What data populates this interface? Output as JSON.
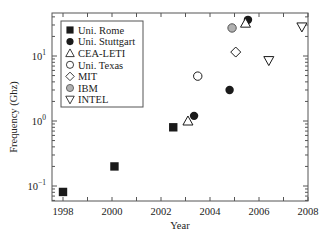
{
  "chart_data": {
    "type": "scatter",
    "title": "",
    "xlabel": "Year",
    "ylabel": "Frequency (Ghz)",
    "xlim": [
      1997.55,
      2008
    ],
    "ylim": [
      0.059,
      46
    ],
    "yscale": "log",
    "grid": false,
    "legend_position": "upper left",
    "x_ticks": [
      1998,
      2000,
      2002,
      2004,
      2006,
      2008
    ],
    "x_tick_labels": [
      "1998",
      "2000",
      "2002",
      "2004",
      "2006",
      "2008"
    ],
    "y_ticks": [
      0.1,
      1,
      10
    ],
    "y_tick_labels": [
      "10^-1",
      "10^0",
      "10^1"
    ],
    "series": [
      {
        "name": "Uni. Rome",
        "marker": "filled-square",
        "points": [
          [
            1998.0,
            0.081
          ],
          [
            2000.1,
            0.2
          ],
          [
            2002.5,
            0.8
          ]
        ]
      },
      {
        "name": "Uni. Stuttgart",
        "marker": "filled-circle",
        "points": [
          [
            2003.35,
            1.2
          ],
          [
            2004.8,
            3.0
          ],
          [
            2005.55,
            36
          ]
        ]
      },
      {
        "name": "CEA-LETI",
        "marker": "open-triangle-up",
        "points": [
          [
            2003.1,
            1.0
          ],
          [
            2005.45,
            32
          ]
        ]
      },
      {
        "name": "Uni. Texas",
        "marker": "open-circle",
        "points": [
          [
            2003.5,
            4.9
          ]
        ]
      },
      {
        "name": "MIT",
        "marker": "open-diamond",
        "points": [
          [
            2005.05,
            11.5
          ]
        ]
      },
      {
        "name": "IBM",
        "marker": "gray-circle",
        "points": [
          [
            2004.9,
            27
          ]
        ]
      },
      {
        "name": "INTEL",
        "marker": "open-triangle-down",
        "points": [
          [
            2006.4,
            8.5
          ],
          [
            2007.75,
            28
          ]
        ]
      }
    ]
  },
  "colors": {
    "ink": "#1a1a1a",
    "ibm_fill": "#b0b0b0",
    "axis": "#555555"
  }
}
